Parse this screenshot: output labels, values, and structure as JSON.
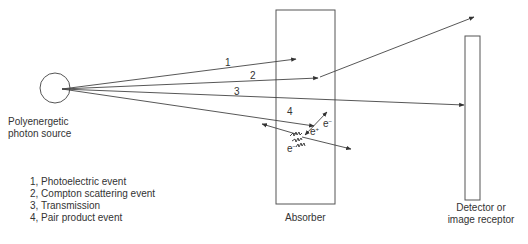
{
  "source": {
    "label_line1": "Polyenergetic",
    "label_line2": "photon source"
  },
  "absorber": {
    "label": "Absorber"
  },
  "detector": {
    "label_line1": "Detector or",
    "label_line2": "image receptor"
  },
  "rays": [
    {
      "id": "1",
      "label": "1",
      "event": "Photoelectric event"
    },
    {
      "id": "2",
      "label": "2",
      "event": "Compton scattering event"
    },
    {
      "id": "3",
      "label": "3",
      "event": "Transmission"
    },
    {
      "id": "4",
      "label": "4",
      "event": "Pair product event"
    }
  ],
  "pair_production": {
    "electron_label": "e",
    "electron_sup": "−",
    "positron_label": "e",
    "positron_sup": "+",
    "electron2_label": "e",
    "electron2_sup": "−"
  },
  "legend": [
    "1, Photoelectric event",
    "2, Compton scattering event",
    "3, Transmission",
    "4, Pair product event"
  ],
  "colors": {
    "line": "#444444",
    "text": "#333333"
  }
}
